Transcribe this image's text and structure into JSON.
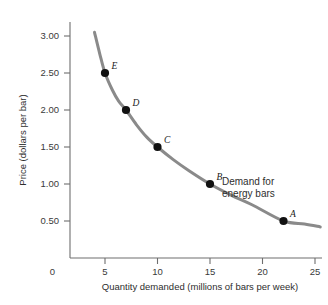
{
  "chart_data": {
    "type": "line",
    "title": "",
    "xlabel": "Quantity demanded (millions of bars per week)",
    "ylabel": "Price (dollars per bar)",
    "xlim": [
      0,
      27
    ],
    "ylim": [
      0,
      3.25
    ],
    "grid": false,
    "legend_position": "inline-annotation",
    "curve_label_line1": "Demand for",
    "curve_label_line2": "energy bars",
    "curve_color": "#8a8a8a",
    "point_color": "#111111",
    "axis_color": "#6e6e6e",
    "xticks": [
      {
        "value": 0,
        "label": "0"
      },
      {
        "value": 5,
        "label": "5"
      },
      {
        "value": 10,
        "label": "10"
      },
      {
        "value": 15,
        "label": "15"
      },
      {
        "value": 20,
        "label": "20"
      },
      {
        "value": 25,
        "label": "25"
      }
    ],
    "yticks": [
      {
        "value": 0.5,
        "label": "0.50"
      },
      {
        "value": 1.0,
        "label": "1.00"
      },
      {
        "value": 1.5,
        "label": "1.50"
      },
      {
        "value": 2.0,
        "label": "2.00"
      },
      {
        "value": 2.5,
        "label": "2.50"
      },
      {
        "value": 3.0,
        "label": "3.00"
      }
    ],
    "points": [
      {
        "label": "A",
        "x": 22,
        "y": 0.5
      },
      {
        "label": "B",
        "x": 15,
        "y": 1.0
      },
      {
        "label": "C",
        "x": 10,
        "y": 1.5
      },
      {
        "label": "D",
        "x": 7,
        "y": 2.0
      },
      {
        "label": "E",
        "x": 5,
        "y": 2.5
      }
    ],
    "curve_points": [
      {
        "x": 4.0,
        "y": 3.05
      },
      {
        "x": 4.5,
        "y": 2.76
      },
      {
        "x": 5.0,
        "y": 2.5
      },
      {
        "x": 5.7,
        "y": 2.27
      },
      {
        "x": 6.3,
        "y": 2.12
      },
      {
        "x": 7.0,
        "y": 2.0
      },
      {
        "x": 8.0,
        "y": 1.8
      },
      {
        "x": 9.0,
        "y": 1.63
      },
      {
        "x": 10.0,
        "y": 1.5
      },
      {
        "x": 11.5,
        "y": 1.33
      },
      {
        "x": 13.0,
        "y": 1.18
      },
      {
        "x": 15.0,
        "y": 1.0
      },
      {
        "x": 17.0,
        "y": 0.85
      },
      {
        "x": 19.0,
        "y": 0.72
      },
      {
        "x": 22.0,
        "y": 0.5
      },
      {
        "x": 24.0,
        "y": 0.46
      },
      {
        "x": 25.5,
        "y": 0.42
      }
    ]
  }
}
